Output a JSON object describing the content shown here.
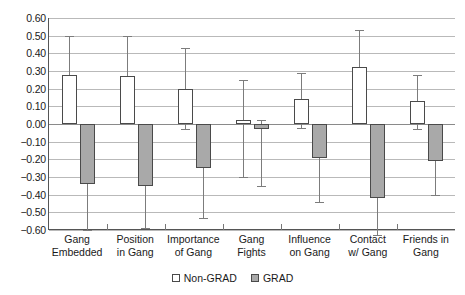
{
  "chart_data": {
    "type": "bar",
    "title": "",
    "subtitle": "",
    "xlabel": "",
    "ylabel": "",
    "ylim": [
      -0.6,
      0.6
    ],
    "ytick_step": 0.1,
    "grid": true,
    "legend_position": "bottom-center",
    "error_bars": true,
    "categories": [
      "Gang\nEmbedded",
      "Position\nin Gang",
      "Importance\nof Gang",
      "Gang\nFights",
      "Influence\non Gang",
      "Contact\nw/ Gang",
      "Friends in\nGang"
    ],
    "yticks": [
      "0.60",
      "0.50",
      "0.40",
      "0.30",
      "0.20",
      "0.10",
      "0.00",
      "-0.10",
      "-0.20",
      "-0.30",
      "-0.40",
      "-0.50",
      "-0.60"
    ],
    "series": [
      {
        "name": "Non-GRAD",
        "color": "#ffffff",
        "values": [
          0.28,
          0.27,
          0.2,
          0.02,
          0.14,
          0.32,
          0.13
        ],
        "err_low": [
          0.05,
          0.04,
          -0.03,
          -0.3,
          -0.02,
          0.12,
          -0.03
        ],
        "err_high": [
          0.5,
          0.5,
          0.43,
          0.25,
          0.29,
          0.53,
          0.28
        ]
      },
      {
        "name": "GRAD",
        "color": "#a9a9a9",
        "values": [
          -0.34,
          -0.35,
          -0.25,
          -0.03,
          -0.19,
          -0.42,
          -0.21
        ],
        "err_low": [
          -0.6,
          -0.59,
          -0.53,
          -0.35,
          -0.44,
          -0.63,
          -0.4
        ],
        "err_high": [
          -0.09,
          -0.1,
          -0.02,
          0.02,
          -0.05,
          -0.21,
          -0.08
        ]
      }
    ]
  },
  "legend": {
    "items": [
      {
        "label": "Non-GRAD",
        "swatch": "open-square"
      },
      {
        "label": "GRAD",
        "swatch": "filled-square"
      }
    ]
  }
}
